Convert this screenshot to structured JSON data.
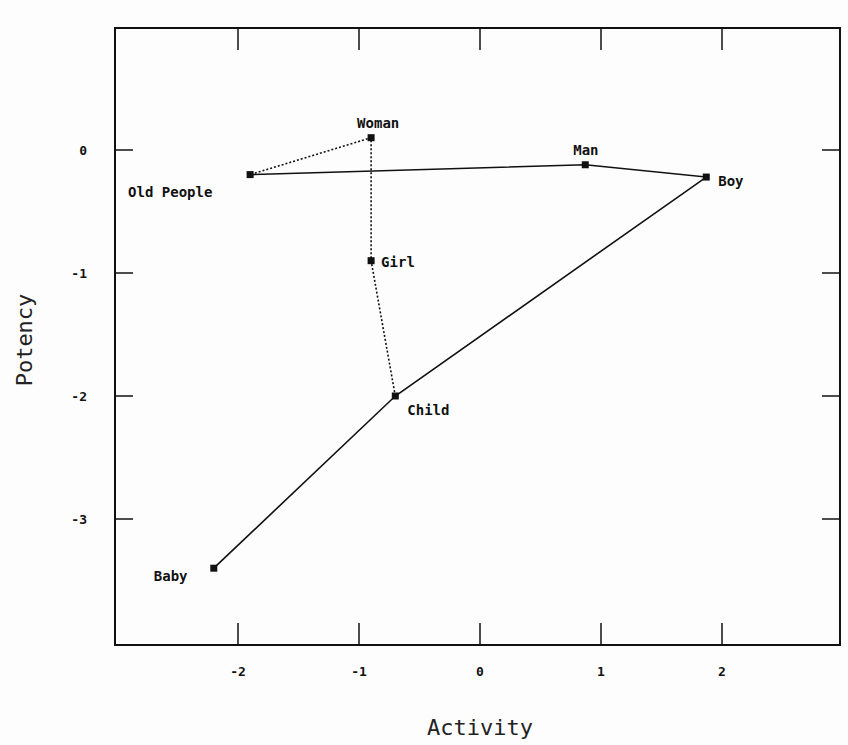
{
  "chart_data": {
    "type": "scatter",
    "title": "",
    "xlabel": "Activity",
    "ylabel": "Potency",
    "xlim": [
      -2.95,
      3.0
    ],
    "ylim": [
      -4.0,
      0.98
    ],
    "xticks": [
      -2,
      -1,
      0,
      1,
      2
    ],
    "yticks": [
      0,
      -1,
      -2,
      -3
    ],
    "xtick_labels": [
      "-2",
      "-1",
      "0",
      "1",
      "2"
    ],
    "ytick_labels": [
      "0",
      "-1",
      "-2",
      "-3"
    ],
    "grid": false,
    "legend": null,
    "points": [
      {
        "label": "Old People",
        "x": -1.9,
        "y": -0.2
      },
      {
        "label": "Woman",
        "x": -0.9,
        "y": 0.1
      },
      {
        "label": "Man",
        "x": 0.87,
        "y": -0.12
      },
      {
        "label": "Boy",
        "x": 1.87,
        "y": -0.22
      },
      {
        "label": "Girl",
        "x": -0.9,
        "y": -0.9
      },
      {
        "label": "Child",
        "x": -0.7,
        "y": -2.0
      },
      {
        "label": "Baby",
        "x": -2.2,
        "y": -3.4
      }
    ],
    "series": [
      {
        "name": "male path (solid)",
        "style": "solid",
        "points": [
          "Baby",
          "Child",
          "Boy",
          "Man",
          "Old People"
        ]
      },
      {
        "name": "female path (dotted)",
        "style": "dotted",
        "points": [
          "Child",
          "Girl",
          "Woman",
          "Old People"
        ]
      }
    ]
  }
}
